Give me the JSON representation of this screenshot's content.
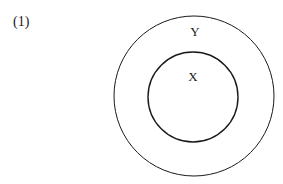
{
  "figure": {
    "number_label": "(1)",
    "sets": [
      {
        "name": "Y",
        "role": "outer",
        "cx": 194,
        "cy": 96,
        "r": 80
      },
      {
        "name": "X",
        "role": "inner",
        "cx": 193,
        "cy": 97,
        "r": 45
      }
    ],
    "relation": "X is a subset of Y",
    "stroke_color": "#1a1a1a"
  }
}
